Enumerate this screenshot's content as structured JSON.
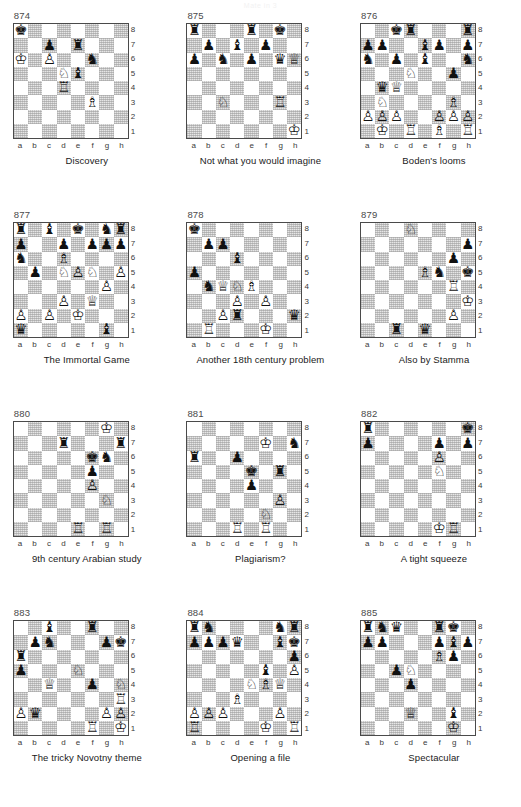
{
  "header": {
    "title": "Mate in 3"
  },
  "board": {
    "files": [
      "a",
      "b",
      "c",
      "d",
      "e",
      "f",
      "g",
      "h"
    ],
    "ranks": [
      "8",
      "7",
      "6",
      "5",
      "4",
      "3",
      "2",
      "1"
    ],
    "glyphs": {
      "wK": "♔",
      "wQ": "♕",
      "wR": "♖",
      "wB": "♗",
      "wN": "♘",
      "wP": "♙",
      "bK": "♚",
      "bQ": "♛",
      "bR": "♜",
      "bB": "♝",
      "bN": "♞",
      "bP": "♟"
    }
  },
  "diagrams": [
    {
      "number": "874",
      "caption": "Discovery",
      "pieces": {
        "a8": "bK",
        "c7": "bP",
        "e7": "bR",
        "a6": "wK",
        "c6": "wP",
        "f6": "bN",
        "d5": "wN",
        "e5": "bB",
        "d4": "wR",
        "f3": "wB"
      }
    },
    {
      "number": "875",
      "caption": "Not what you would imagine",
      "pieces": {
        "a8": "bR",
        "e8": "bR",
        "g8": "bK",
        "b7": "bP",
        "d7": "bB",
        "f7": "bP",
        "a6": "bP",
        "c6": "bN",
        "e6": "bP",
        "g6": "bQ",
        "h6": "wQ",
        "c3": "wN",
        "g3": "wR",
        "h1": "wK"
      }
    },
    {
      "number": "876",
      "caption": "Boden's looms",
      "pieces": {
        "c8": "bK",
        "d8": "bR",
        "h8": "bR",
        "a7": "bP",
        "b7": "bP",
        "e7": "bB",
        "f7": "bP",
        "h7": "bP",
        "a6": "bN",
        "c6": "bP",
        "e6": "bB",
        "h6": "bN",
        "d5": "wN",
        "g5": "bP",
        "b4": "bQ",
        "c4": "wQ",
        "b3": "wN",
        "g3": "wB",
        "a2": "wP",
        "b2": "wP",
        "c2": "wP",
        "f2": "wP",
        "g2": "wP",
        "h2": "wP",
        "b1": "wK",
        "d1": "wR",
        "f1": "wB",
        "h1": "wR"
      }
    },
    {
      "number": "877",
      "caption": "The Immortal Game",
      "pieces": {
        "a8": "bR",
        "c8": "bB",
        "e8": "bK",
        "g8": "bN",
        "h8": "bR",
        "a7": "bP",
        "d7": "bP",
        "f7": "bP",
        "g7": "bP",
        "h7": "bP",
        "a6": "bN",
        "d6": "wB",
        "b5": "bP",
        "d5": "wN",
        "e5": "wP",
        "f5": "wN",
        "h5": "wP",
        "g4": "wP",
        "d3": "wP",
        "f3": "wQ",
        "a2": "wP",
        "c2": "wP",
        "e2": "wK",
        "a1": "bQ",
        "g1": "bB"
      }
    },
    {
      "number": "878",
      "caption": "Another 18th century problem",
      "pieces": {
        "a8": "bK",
        "b7": "bP",
        "c7": "bP",
        "d6": "bB",
        "a5": "bP",
        "b4": "bN",
        "c4": "wQ",
        "d4": "wN",
        "e4": "wB",
        "d3": "wP",
        "f3": "wP",
        "c2": "wP",
        "d2": "bR",
        "h2": "bQ",
        "b1": "wR",
        "f1": "wK"
      }
    },
    {
      "number": "879",
      "caption": "Also by Stamma",
      "pieces": {
        "d8": "wN",
        "h7": "bP",
        "g6": "bP",
        "e5": "wB",
        "f5": "bN",
        "h5": "bK",
        "g4": "wR",
        "h3": "wK",
        "g2": "wP",
        "c1": "bR",
        "e1": "bQ"
      }
    },
    {
      "number": "880",
      "caption": "9th century Arabian study",
      "pieces": {
        "g8": "wK",
        "d7": "bR",
        "h7": "bR",
        "f6": "bK",
        "g6": "bN",
        "f5": "bP",
        "f4": "wP",
        "g3": "wN",
        "e1": "wR",
        "g1": "wR"
      }
    },
    {
      "number": "881",
      "caption": "Plagiarism?",
      "pieces": {
        "f7": "wK",
        "h7": "bN",
        "a6": "bR",
        "d6": "bP",
        "e5": "bK",
        "g5": "bR",
        "e4": "bP",
        "g3": "wP",
        "f2": "wN",
        "d1": "wR",
        "f1": "wR"
      }
    },
    {
      "number": "882",
      "caption": "A tight squeeze",
      "pieces": {
        "a8": "bR",
        "h8": "bK",
        "a7": "bP",
        "f7": "bP",
        "h7": "bP",
        "f6": "wP",
        "f5": "wN",
        "f1": "wK",
        "g1": "wR"
      }
    },
    {
      "number": "883",
      "caption": "The tricky Novotny theme",
      "pieces": {
        "c8": "bB",
        "f8": "bR",
        "b7": "bP",
        "c7": "bN",
        "g7": "bP",
        "h7": "bK",
        "a6": "bR",
        "a5": "bP",
        "e5": "wN",
        "c4": "wQ",
        "f4": "bP",
        "h4": "wN",
        "h3": "wR",
        "a2": "wP",
        "b2": "bQ",
        "g2": "wP",
        "h2": "wP",
        "f1": "wR",
        "h1": "wK"
      }
    },
    {
      "number": "884",
      "caption": "Opening a file",
      "pieces": {
        "a8": "bR",
        "b8": "bN",
        "g8": "bN",
        "h8": "bR",
        "a7": "bP",
        "b7": "bP",
        "c7": "bP",
        "d7": "bQ",
        "g7": "bB",
        "h7": "bK",
        "h6": "bP",
        "f5": "bB",
        "h5": "wP",
        "e4": "wN",
        "f4": "wB",
        "g4": "wQ",
        "d3": "wB",
        "a2": "wP",
        "b2": "wP",
        "c2": "wP",
        "g2": "wP",
        "a1": "wR",
        "f1": "wK",
        "h1": "wR"
      }
    },
    {
      "number": "885",
      "caption": "Spectacular",
      "pieces": {
        "a8": "bR",
        "b8": "bN",
        "c8": "bQ",
        "f8": "bR",
        "g8": "bK",
        "a7": "bP",
        "b7": "bP",
        "f7": "bP",
        "g7": "bB",
        "h7": "bP",
        "f6": "wB",
        "g6": "bP",
        "c5": "bP",
        "d5": "wN",
        "d4": "bP",
        "d2": "wQ",
        "g2": "bB",
        "g1": "wK"
      }
    }
  ]
}
